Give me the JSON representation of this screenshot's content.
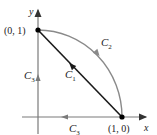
{
  "diagram": {
    "axes": {
      "x_label": "x",
      "y_label": "y"
    },
    "points": [
      {
        "id": "p01",
        "label": "(0, 1)"
      },
      {
        "id": "p10",
        "label": "(1, 0)"
      }
    ],
    "curves": {
      "c1": {
        "name": "C",
        "sub": "1",
        "description": "line segment from (1,0) to (0,1)"
      },
      "c2": {
        "name": "C",
        "sub": "2",
        "description": "quarter-circle arc from (0,1) to (1,0)"
      },
      "c3_vertical": {
        "name": "C",
        "sub": "3",
        "description": "y-axis segment from (0,0) to (0,1)"
      },
      "c3_horizontal": {
        "name": "C",
        "sub": "3",
        "description": "x-axis segment from (1,0) to (0,0)"
      }
    },
    "colors": {
      "axis": "#7a7a7a",
      "segment": "#1a1a1a",
      "arc": "#8a8a8a",
      "point": "#000000"
    }
  }
}
